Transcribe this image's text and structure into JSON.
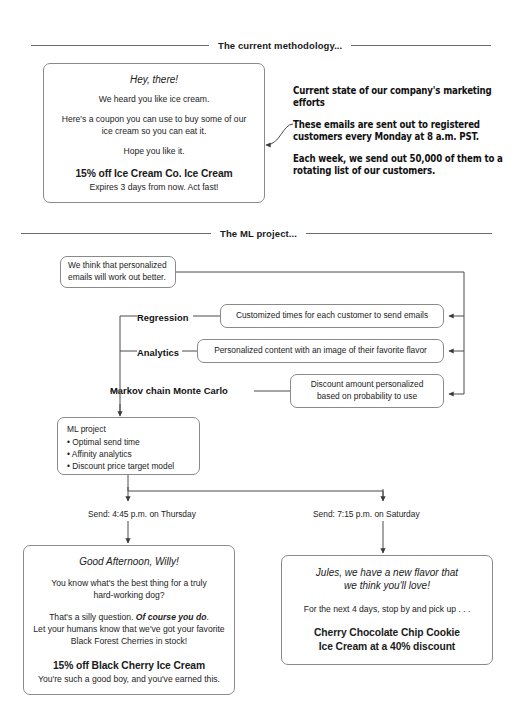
{
  "sections": {
    "current": "The current methodology...",
    "ml": "The ML project..."
  },
  "email_current": {
    "header": "Hey, there!",
    "line1": "We heard you like ice cream.",
    "line2a": "Here's a coupon you can use to buy some of our",
    "line2b": "ice cream so you can eat it.",
    "line3": "Hope you like it.",
    "offer": "15% off Ice Cream Co. Ice Cream",
    "expiry": "Expires 3 days from now. Act fast!"
  },
  "marketing_blurb": {
    "p1": "Current state of our company's marketing efforts",
    "p2": "These emails are sent out to registered customers every Monday at 8 a.m. PST.",
    "p3": "Each week, we send out 50,000 of them to a rotating list of our customers."
  },
  "hypothesis": {
    "line1": "We think that personalized",
    "line2": "emails will work out better."
  },
  "methods": [
    {
      "label": "Regression",
      "desc_line1": "Customized times for each customer to send emails",
      "desc_line2": ""
    },
    {
      "label": "Analytics",
      "desc_line1": "Personalized content with an image of their favorite flavor",
      "desc_line2": ""
    },
    {
      "label": "Markov chain Monte Carlo",
      "desc_line1": "Discount amount personalized",
      "desc_line2": "based on probability to use"
    }
  ],
  "ml_project": {
    "title": "ML project",
    "bullets": [
      "• Optimal send time",
      "• Affinity analytics",
      "• Discount price target model"
    ]
  },
  "sends": {
    "left": "Send: 4:45 p.m. on Thursday",
    "right": "Send: 7:15 p.m. on Saturday"
  },
  "email_left": {
    "header": "Good Afternoon, Willy!",
    "line1a": "You know what's the best thing for a truly",
    "line1b": "hard-working dog?",
    "line2_pre": "That's a silly question. ",
    "line2_em": "Of course you do",
    "line2_post": ".",
    "line3": "Let your humans know that we've got your favorite",
    "line4": "Black Forest Cherries in stock!",
    "offer": "15% off Black Cherry Ice Cream",
    "closing": "You're such a good boy, and you've earned this."
  },
  "email_right": {
    "header_a": "Jules, we have a new flavor that",
    "header_b": "we think you'll love!",
    "line1": "For the next 4 days, stop by and pick up . . .",
    "offer_a": "Cherry Chocolate Chip Cookie",
    "offer_b": "Ice Cream at a 40% discount"
  },
  "colors": {
    "ink": "#1a1a1a",
    "stroke": "#8a8a8a",
    "rule": "#6b6b6b",
    "wire": "#4a4a4a"
  }
}
